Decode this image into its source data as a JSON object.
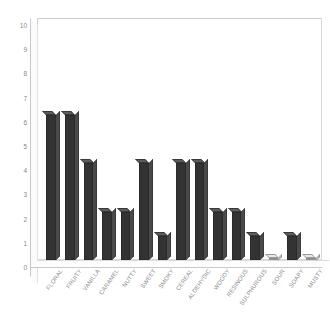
{
  "chart_data": {
    "type": "bar",
    "title": "",
    "subtitle": "",
    "xlabel": "",
    "ylabel": "",
    "ylim": [
      0,
      10
    ],
    "ytick_labels": [
      "0",
      "1",
      "2",
      "3",
      "4",
      "5",
      "6",
      "7",
      "8",
      "9",
      "10"
    ],
    "ytick_values": [
      0,
      1,
      2,
      3,
      4,
      5,
      6,
      7,
      8,
      9,
      10
    ],
    "grid": false,
    "legend": false,
    "legend_position": "none",
    "orientation": "vertical",
    "style": "3d",
    "categories": [
      "FLORAL",
      "FRUITY",
      "VANILLA",
      "CARAMEL",
      "NUTTY",
      "SWEET",
      "SMOKY",
      "CEREAL",
      "ALDEHYDIC",
      "WOODY",
      "RESINOUS",
      "SULPHUROUS",
      "SOUR",
      "SOAPY",
      "MUSTY"
    ],
    "values": [
      6,
      6,
      4,
      2,
      2,
      4,
      1,
      4,
      4,
      2,
      2,
      1,
      0,
      1,
      0
    ],
    "colors": {
      "bar_front": "#333333",
      "bar_side": "#4a4a4a",
      "bar_top": "#5c5c5c",
      "axis_line": "#c9c9c9",
      "frame": "#cfcfcf",
      "tick_text": "#8a8a8a",
      "category_text": "#8d8d8d",
      "background": "#ffffff"
    }
  }
}
